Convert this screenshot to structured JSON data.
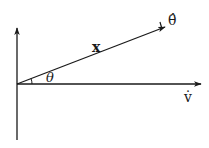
{
  "diagram": {
    "type": "vector-diagram",
    "labels": {
      "theta_hat": "θ̂",
      "x": "x",
      "theta": "θ",
      "v_dot": "v̇"
    },
    "colors": {
      "line": "#1a1a1a",
      "background": "#ffffff"
    },
    "elements": {
      "vertical_axis": {
        "from": [
          17,
          140
        ],
        "to": [
          17,
          28
        ]
      },
      "horizontal_axis": {
        "from": [
          17,
          84
        ],
        "to": [
          201,
          84
        ]
      },
      "vector_x": {
        "from": [
          17,
          84
        ],
        "to": [
          165,
          27
        ]
      },
      "angle_arc": {
        "between": [
          "horizontal_axis",
          "vector_x"
        ],
        "label": "θ"
      }
    }
  }
}
